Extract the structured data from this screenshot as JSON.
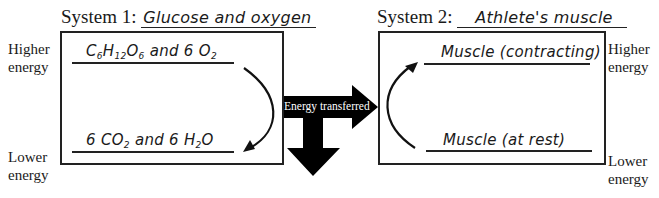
{
  "system1": {
    "label": "System 1:",
    "value": "Glucose and oxygen",
    "higher_state": {
      "parts": [
        "C",
        "6",
        "H",
        "12",
        "O",
        "6",
        " and 6 O",
        "2"
      ]
    },
    "lower_state": {
      "parts": [
        "6 CO",
        "2",
        " and 6 H",
        "2",
        "O"
      ]
    },
    "higher_label_line1": "Higher",
    "higher_label_line2": "energy",
    "lower_label_line1": "Lower",
    "lower_label_line2": "energy"
  },
  "system2": {
    "label": "System 2:",
    "value": "Athlete's muscle",
    "higher_state": "Muscle (contracting)",
    "lower_state": "Muscle (at rest)",
    "higher_label_line1": "Higher",
    "higher_label_line2": "energy",
    "lower_label_line1": "Lower",
    "lower_label_line2": "energy"
  },
  "transfer": {
    "label": "Energy transferred",
    "arrow_color": "#000000"
  }
}
